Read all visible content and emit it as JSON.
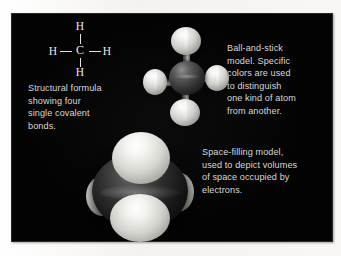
{
  "figure": {
    "background_color": "#030303",
    "page_color": "#f9f8f5",
    "text_color": "#d9d9d6"
  },
  "structural_formula": {
    "atoms": {
      "top": "H",
      "left": "H",
      "center": "C",
      "right": "H",
      "bottom": "H"
    }
  },
  "captions": {
    "structural": "Structural formula\nshowing four\nsingle covalent\nbonds.",
    "ball_and_stick": "Ball-and-stick\nmodel. Specific\ncolors are used\nto distinguish\none kind of atom\nfrom another.",
    "space_filling": "Space-filling model,\nused to depict volumes\nof space occupied by\nelectrons."
  },
  "models": {
    "ball_and_stick": {
      "carbon_color": "#343434",
      "hydrogen_color": "#e8e8e4",
      "bond_color": "#8d8d8d"
    },
    "space_filling": {
      "carbon_color": "#1b1b1b",
      "hydrogen_color": "#ededea"
    }
  }
}
